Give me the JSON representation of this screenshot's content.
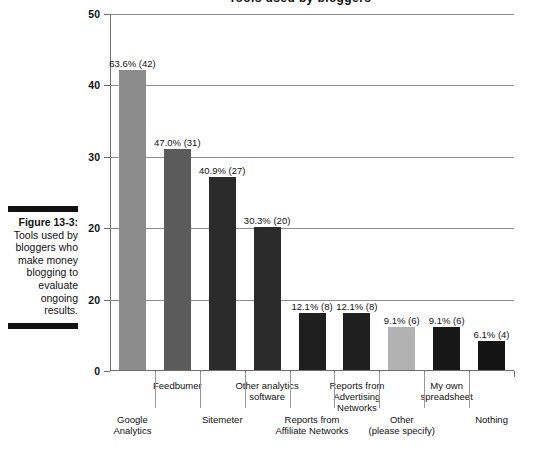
{
  "figure": {
    "caption_number": "Figure 13-3:",
    "caption_text": "Tools used by bloggers who make money blogging to evaluate ongoing results.",
    "title_clipped": "Tools used by bloggers"
  },
  "chart_data": {
    "type": "bar",
    "title": "",
    "xlabel": "",
    "ylabel": "",
    "ylim": [
      0,
      50
    ],
    "grid": true,
    "legend": "none",
    "ytick_labels": [
      "50",
      "40",
      "30",
      "20",
      "20",
      "0"
    ],
    "ytick_values": [
      50,
      40,
      30,
      20,
      10,
      0
    ],
    "categories": [
      "Google Analytics",
      "Feedbumer",
      "Sitemeter",
      "Other analytics software",
      "Reports from Affiliate Networks",
      "Reports from Advertising Networks",
      "Other (please specify)",
      "My own spreadsheet",
      "Nothing"
    ],
    "values": [
      42,
      31,
      27,
      20,
      8,
      8,
      6,
      6,
      4
    ],
    "percents": [
      "63.6%",
      "47.0%",
      "40.9%",
      "30.3%",
      "12.1%",
      "12.1%",
      "9.1%",
      "9.1%",
      "6.1%"
    ],
    "data_labels": [
      "63.6% (42)",
      "47.0% (31)",
      "40.9% (27)",
      "30.3% (20)",
      "12.1% (8)",
      "12.1% (8)",
      "9.1% (6)",
      "9.1% (6)",
      "6.1% (4)"
    ],
    "bar_colors": [
      "#8c8c8c",
      "#5b5b5b",
      "#2b2b2b",
      "#2b2b2b",
      "#1f1f1f",
      "#1f1f1f",
      "#b2b2b2",
      "#171717",
      "#141414"
    ],
    "category_rows": [
      1,
      0,
      1,
      0,
      1,
      0,
      1,
      0,
      1
    ]
  },
  "xaxis_labels": {
    "row_top": [
      "Feedbumer",
      "Other analytics\nsoftware",
      "Reports from\nAdvertising\nNetworks",
      "My own\nspreadsheet"
    ],
    "row_bottom": [
      "Google\nAnalytics",
      "Sitemeter",
      "Reports from\nAffiliate Networks",
      "Other\n(please specify)",
      "Nothing"
    ]
  }
}
